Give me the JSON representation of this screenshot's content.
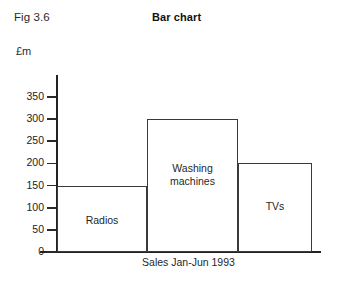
{
  "figure": {
    "fig_label": "Fig 3.6",
    "title": "Bar chart",
    "unit_label": "£m",
    "x_caption": "Sales Jan-Jun 1993"
  },
  "colors": {
    "background": "#ffffff",
    "axis": "#222222",
    "bar_outline": "#3a3a3a",
    "bar_fill": "#ffffff",
    "text": "#1f1f1f"
  },
  "chart_data": {
    "type": "bar",
    "title": "Bar chart",
    "xlabel": "Sales Jan-Jun 1993",
    "ylabel": "£m",
    "categories": [
      "Radios",
      "Washing machines",
      "TVs"
    ],
    "values": [
      150,
      300,
      200
    ],
    "ylim": [
      0,
      350
    ],
    "yticks": [
      0,
      50,
      100,
      150,
      200,
      250,
      300,
      350
    ],
    "ytick_labels": [
      "0",
      "50",
      "100",
      "150",
      "200",
      "250",
      "300",
      "350"
    ],
    "grid": false,
    "legend": false,
    "bars": [
      {
        "label": "Radios",
        "value": 150
      },
      {
        "label": "Washing machines",
        "value": 300
      },
      {
        "label": "TVs",
        "value": 200
      }
    ]
  }
}
